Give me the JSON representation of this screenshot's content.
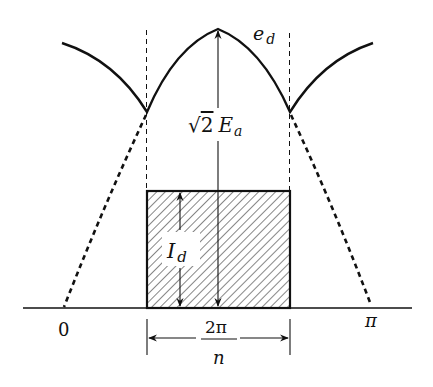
{
  "diagram": {
    "type": "rectifier-waveform",
    "colors": {
      "stroke": "#111111",
      "background": "#ffffff",
      "hatch": "#222222"
    },
    "labels": {
      "voltage_curve": {
        "main": "e",
        "sub": "d"
      },
      "peak_amplitude": {
        "radical": "√",
        "coef": "2",
        "main": "E",
        "sub": "a"
      },
      "current": {
        "main": "I",
        "sub": "d"
      },
      "origin": "0",
      "pi": "π",
      "width_numerator": "2π",
      "width_denominator": "n"
    },
    "geometry": {
      "baseline_y": 308,
      "baseline_x": [
        23,
        412
      ],
      "peak": [
        218,
        29
      ],
      "left_cusp": [
        147,
        112
      ],
      "right_cusp": [
        290,
        112
      ],
      "left_arc_start": [
        62,
        43
      ],
      "right_arc_end": [
        373,
        43
      ],
      "zero_x": 64,
      "pi_x": 371,
      "rect": {
        "x": 147,
        "y": 191,
        "w": 143,
        "h": 117
      }
    }
  }
}
